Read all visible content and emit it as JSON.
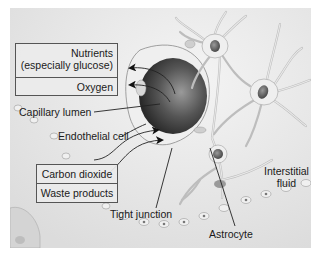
{
  "diagram": {
    "colors": {
      "background": "#e6e6e6",
      "lumen_dark": "#3a3a3a",
      "cell_fill": "#f2f2f2",
      "text": "#1a1a1a",
      "line": "#222222"
    },
    "boxes": {
      "into_brain": {
        "items": [
          {
            "line1": "Nutrients",
            "line2": "(especially glucose)"
          },
          {
            "line1": "Oxygen"
          }
        ]
      },
      "out_of_brain": {
        "items": [
          {
            "line1": "Carbon dioxide"
          },
          {
            "line1": "Waste products"
          }
        ]
      }
    },
    "labels": {
      "capillary_lumen": "Capillary lumen",
      "endothelial_cell": "Endothelial cell",
      "tight_junction": "Tight junction",
      "astrocyte": "Astrocyte",
      "interstitial_fluid_line1": "Interstitial",
      "interstitial_fluid_line2": "fluid"
    }
  }
}
